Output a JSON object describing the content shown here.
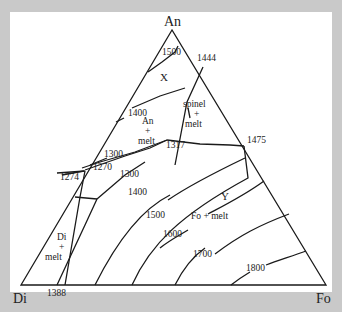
{
  "diagram": {
    "type": "ternary phase diagram",
    "vertices": {
      "top": "An",
      "left": "Di",
      "right": "Fo"
    },
    "fields": {
      "x_label": "X",
      "y_label": "Y",
      "spinel": {
        "l1": "spinel",
        "l2": "+",
        "l3": "melt"
      },
      "an_melt": {
        "l1": "An",
        "l2": "+",
        "l3": "melt"
      },
      "di_melt": {
        "l1": "Di",
        "l2": "+",
        "l3": "melt"
      },
      "fo_melt": "Fo + melt"
    },
    "temperatures": {
      "t1500_top": "1500",
      "t1444": "1444",
      "t1400_an": "1400",
      "t1317": "1317",
      "t1475": "1475",
      "t1300_a": "1300",
      "t1270": "1270",
      "t1274": "1274",
      "t1300_b": "1300",
      "t1400": "1400",
      "t1500": "1500",
      "t1600": "1600",
      "t1700": "1700",
      "t1800": "1800",
      "t1388": "1388"
    }
  }
}
